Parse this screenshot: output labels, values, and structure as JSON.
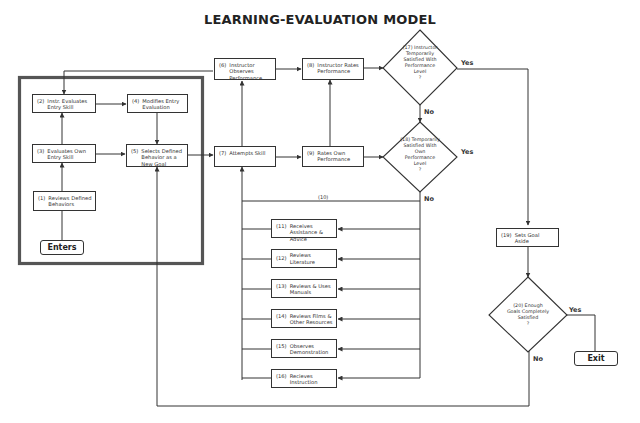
{
  "title": "LEARNING-EVALUATION MODEL",
  "nodes": {
    "n1": {
      "num": "(1)",
      "text": "Reviews Defined Behaviors"
    },
    "n2": {
      "num": "(2)",
      "text": "Instr. Evaluates Entry Skill"
    },
    "n3": {
      "num": "(3)",
      "text": "Evaluates Own Entry Skill"
    },
    "n4": {
      "num": "(4)",
      "text": "Modifies Entry Evaluation"
    },
    "n5": {
      "num": "(5)",
      "text": "Selects Defined Behavior as a New Goal"
    },
    "n6": {
      "num": "(6)",
      "text": "Instructor Observes Performance"
    },
    "n7": {
      "num": "(7)",
      "text": "Attempts Skill"
    },
    "n8": {
      "num": "(8)",
      "text": "Instructor Rates Performance"
    },
    "n9": {
      "num": "(9)",
      "text": "Rates Own Performance"
    },
    "n10": {
      "num": "(10)"
    },
    "n11": {
      "num": "(11)",
      "text": "Receives Assistance & Advice"
    },
    "n12": {
      "num": "(12)",
      "text": "Reviews Literature"
    },
    "n13": {
      "num": "(13)",
      "text": "Reviews & Uses Manuals"
    },
    "n14": {
      "num": "(14)",
      "text": "Reviews Films & Other Resources"
    },
    "n15": {
      "num": "(15)",
      "text": "Observes Demonstration"
    },
    "n16": {
      "num": "(16)",
      "text": "Recieves Instruction"
    },
    "n19": {
      "num": "(19)",
      "text": "Sets Goal Aside"
    }
  },
  "decisions": {
    "d17": {
      "lines": [
        "(17) Instructor",
        "Temporarily",
        "Satisfied With",
        "Performance",
        "Level",
        "?"
      ]
    },
    "d18": {
      "lines": [
        "(18) Temporarily",
        "Satisfied With",
        "Own",
        "Performance",
        "Level",
        "?"
      ]
    },
    "d20": {
      "lines": [
        "(20) Enough",
        "Goals Completely",
        "Satisfied",
        "?"
      ]
    }
  },
  "terminals": {
    "enters": "Enters",
    "exit": "Exit"
  },
  "edge_labels": {
    "d17_yes": "Yes",
    "d17_no": "No",
    "d18_yes": "Yes",
    "d18_no": "No",
    "d20_yes": "Yes",
    "d20_no": "No"
  },
  "colors": {
    "line": "#333333",
    "frame": "#555555",
    "background": "#ffffff"
  }
}
